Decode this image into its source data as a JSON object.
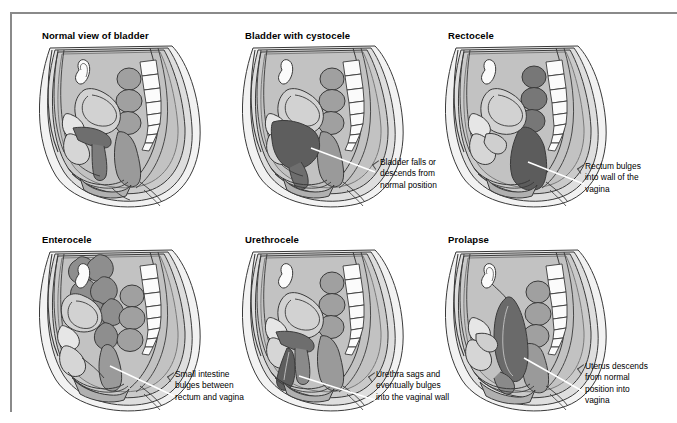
{
  "figure": {
    "type": "medical-illustration-grid",
    "rows": 2,
    "columns": 3
  },
  "colors": {
    "frame_border": "#8a8a8a",
    "page_background": "#ffffff",
    "body_outline": "#3a3a3a",
    "body_fill": "#f2f2f2",
    "soft_tissue_light": "#d4d4d4",
    "soft_tissue_mid": "#b4b4b4",
    "organ_mid_gray": "#a0a0a0",
    "organ_dark_gray": "#6e6e6e",
    "organ_darkest": "#5a5a5a",
    "bone_white": "#fbfbfb",
    "leader_line": "#ffffff",
    "text": "#000000"
  },
  "panels": [
    {
      "id": "normal-view-of-bladder",
      "title": "Normal view of bladder",
      "caption": "",
      "has_caption": false,
      "highlight": "bladder-normal"
    },
    {
      "id": "bladder-with-cystocele",
      "title": "Bladder with cystocele",
      "caption": "Bladder falls or\ndescends from\nnormal position",
      "has_caption": true,
      "highlight": "bladder-descended"
    },
    {
      "id": "rectocele",
      "title": "Rectocele",
      "caption": "Rectum bulges\ninto wall of the\nvagina",
      "has_caption": true,
      "highlight": "rectum-bulging"
    },
    {
      "id": "enterocele",
      "title": "Enterocele",
      "caption": "Small intestine\nbulges between\nrectum and vagina",
      "has_caption": true,
      "highlight": "small-intestine-bulging"
    },
    {
      "id": "urethrocele",
      "title": "Urethrocele",
      "caption": "Urethra sags and\neventually bulges\ninto the vaginal wall",
      "has_caption": true,
      "highlight": "urethra-sagging"
    },
    {
      "id": "prolapse",
      "title": "Prolapse",
      "caption": "Uterus descends\nfrom normal\nposition into\nvagina",
      "has_caption": true,
      "highlight": "uterus-descended"
    }
  ]
}
